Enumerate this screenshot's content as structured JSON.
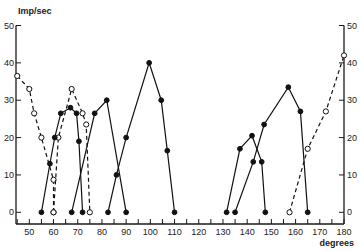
{
  "chart_data": {
    "type": "line",
    "title": "",
    "xlabel": "degrees",
    "ylabel": "Imp/sec",
    "xlim": [
      44.5,
      180
    ],
    "ylim": [
      0,
      50
    ],
    "x_ticks": [
      50,
      60,
      70,
      80,
      90,
      100,
      110,
      120,
      130,
      140,
      150,
      160,
      170,
      180
    ],
    "x_minor_ticks": [
      45,
      55,
      65,
      75,
      85,
      95,
      105,
      115,
      125,
      135,
      145,
      155,
      165,
      175
    ],
    "y_ticks_left": [
      0,
      10,
      20,
      30,
      40,
      50
    ],
    "y_ticks_right": [
      0,
      10,
      20,
      30,
      40,
      50
    ],
    "grid": false,
    "legend": "none",
    "series": [
      {
        "name": "dashed-open-1",
        "style": "dashed",
        "marker": "open",
        "points": [
          [
            45,
            36.5
          ],
          [
            50,
            33
          ],
          [
            52,
            26.5
          ],
          [
            55,
            20
          ],
          [
            60,
            8.7
          ],
          [
            60,
            0
          ]
        ]
      },
      {
        "name": "dashed-open-2",
        "style": "dashed",
        "marker": "open",
        "points": [
          [
            60,
            0
          ],
          [
            62,
            20
          ],
          [
            67.5,
            33
          ],
          [
            72,
            26.5
          ],
          [
            73.5,
            23.5
          ],
          [
            75,
            0
          ]
        ]
      },
      {
        "name": "solid-filled-1",
        "style": "solid",
        "marker": "filled",
        "points": [
          [
            55,
            0
          ],
          [
            58.5,
            13
          ],
          [
            60.5,
            20
          ],
          [
            63,
            26.5
          ],
          [
            67,
            28
          ],
          [
            69.5,
            26.5
          ],
          [
            70.5,
            19
          ],
          [
            72,
            0
          ]
        ]
      },
      {
        "name": "solid-filled-2",
        "style": "solid",
        "marker": "filled",
        "points": [
          [
            67.5,
            0
          ],
          [
            77,
            26.5
          ],
          [
            82,
            30
          ],
          [
            90,
            0
          ]
        ]
      },
      {
        "name": "solid-filled-3",
        "style": "solid",
        "marker": "filled",
        "points": [
          [
            82.5,
            0
          ],
          [
            86,
            10
          ],
          [
            90,
            20
          ],
          [
            99.5,
            40
          ],
          [
            104.5,
            30
          ],
          [
            107,
            16.5
          ],
          [
            110,
            0
          ]
        ]
      },
      {
        "name": "solid-filled-4",
        "style": "solid",
        "marker": "filled",
        "points": [
          [
            131.5,
            0
          ],
          [
            137,
            17
          ],
          [
            142,
            20.5
          ],
          [
            146,
            13.5
          ],
          [
            147.5,
            0
          ]
        ]
      },
      {
        "name": "solid-filled-5",
        "style": "solid",
        "marker": "filled",
        "points": [
          [
            135,
            0
          ],
          [
            142.5,
            13.5
          ],
          [
            147,
            23.5
          ],
          [
            157,
            33.5
          ],
          [
            162,
            27
          ],
          [
            165,
            0
          ]
        ]
      },
      {
        "name": "dashed-open-3",
        "style": "dashed",
        "marker": "open",
        "points": [
          [
            157.5,
            0
          ],
          [
            165,
            17
          ],
          [
            172.5,
            27
          ],
          [
            180,
            42
          ]
        ]
      }
    ]
  }
}
